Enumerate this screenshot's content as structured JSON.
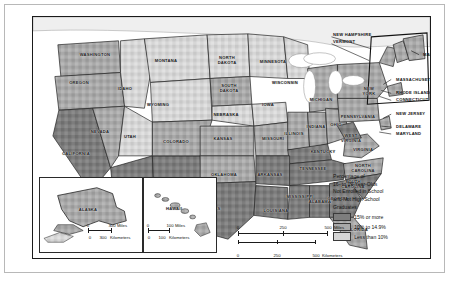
{
  "map": {
    "title_hidden": "",
    "legend": {
      "title_lines": [
        "Percentage of",
        "16- to 19-Year-Olds",
        "Not Enrolled in School",
        "and Not High School",
        "Graduates"
      ],
      "classes": [
        {
          "label": "15% or more",
          "color": "#7d7d7d"
        },
        {
          "label": "10% to 14.9%",
          "color": "#a9a9a9"
        },
        {
          "label": "Less than 10%",
          "color": "#d6d6d6"
        }
      ]
    },
    "scales": {
      "main": {
        "miles": {
          "ticks": [
            "0",
            "250",
            "500"
          ],
          "unit": "Miles"
        },
        "kilometers": {
          "ticks": [
            "0",
            "250",
            "500"
          ],
          "unit": "Kilometers"
        }
      },
      "alaska": {
        "miles": {
          "ticks": [
            "0",
            "300"
          ],
          "unit": "Miles"
        },
        "kilometers": {
          "ticks": [
            "0",
            "300"
          ],
          "unit": "Kilometers"
        }
      },
      "hawaii": {
        "miles": {
          "ticks": [
            "0",
            "100"
          ],
          "unit": "Miles"
        },
        "kilometers": {
          "ticks": [
            "0",
            "100"
          ],
          "unit": "Kilometers"
        }
      }
    },
    "insets": [
      {
        "name": "alaska",
        "label": "ALASKA"
      },
      {
        "name": "hawaii",
        "label": "HAWAII"
      }
    ],
    "state_labels": [
      {
        "name": "washington",
        "text": "WASHINGTON",
        "x": 62,
        "y": 38
      },
      {
        "name": "oregon",
        "text": "OREGON",
        "x": 46,
        "y": 66
      },
      {
        "name": "idaho",
        "text": "IDAHO",
        "x": 92,
        "y": 72
      },
      {
        "name": "montana",
        "text": "MONTANA",
        "x": 133,
        "y": 44
      },
      {
        "name": "wyoming",
        "text": "WYOMING",
        "x": 125,
        "y": 88
      },
      {
        "name": "north-dakota",
        "text": "NORTH\nDAKOTA",
        "x": 194,
        "y": 44
      },
      {
        "name": "south-dakota",
        "text": "SOUTH\nDAKOTA",
        "x": 196,
        "y": 72
      },
      {
        "name": "minnesota",
        "text": "MINNESOTA",
        "x": 240,
        "y": 45
      },
      {
        "name": "nebraska",
        "text": "NEBRASKA",
        "x": 193,
        "y": 98
      },
      {
        "name": "iowa",
        "text": "IOWA",
        "x": 235,
        "y": 88
      },
      {
        "name": "wisconsin",
        "text": "WISCONSIN",
        "x": 252,
        "y": 66
      },
      {
        "name": "michigan",
        "text": "MICHIGAN",
        "x": 288,
        "y": 83
      },
      {
        "name": "illinois",
        "text": "ILLINOIS",
        "x": 261,
        "y": 117
      },
      {
        "name": "indiana",
        "text": "INDIANA",
        "x": 283,
        "y": 110
      },
      {
        "name": "ohio",
        "text": "OHIO",
        "x": 303,
        "y": 108
      },
      {
        "name": "missouri",
        "text": "MISSOURI",
        "x": 240,
        "y": 122
      },
      {
        "name": "kansas",
        "text": "KANSAS",
        "x": 190,
        "y": 122
      },
      {
        "name": "colorado",
        "text": "COLORADO",
        "x": 143,
        "y": 125
      },
      {
        "name": "utah",
        "text": "UTAH",
        "x": 97,
        "y": 120
      },
      {
        "name": "nevada",
        "text": "NEVADA",
        "x": 67,
        "y": 115
      },
      {
        "name": "california",
        "text": "CALIFORNIA",
        "x": 43,
        "y": 137
      },
      {
        "name": "arizona",
        "text": "ARIZONA",
        "x": 96,
        "y": 170
      },
      {
        "name": "new-mexico",
        "text": "NEW\nMEXICO",
        "x": 143,
        "y": 172
      },
      {
        "name": "oklahoma",
        "text": "OKLAHOMA",
        "x": 191,
        "y": 158
      },
      {
        "name": "texas",
        "text": "TEXAS",
        "x": 180,
        "y": 192
      },
      {
        "name": "arkansas",
        "text": "ARKANSAS",
        "x": 237,
        "y": 158
      },
      {
        "name": "louisiana",
        "text": "LOUISIANA",
        "x": 243,
        "y": 194
      },
      {
        "name": "mississippi",
        "text": "MISSISSIPPI",
        "x": 267,
        "y": 180
      },
      {
        "name": "alabama",
        "text": "ALABAMA",
        "x": 287,
        "y": 185
      },
      {
        "name": "tennessee",
        "text": "TENNESSEE",
        "x": 280,
        "y": 152
      },
      {
        "name": "kentucky",
        "text": "KENTUCKY",
        "x": 290,
        "y": 135
      },
      {
        "name": "west-virginia",
        "text": "WEST\nVIRGINIA",
        "x": 318,
        "y": 122
      },
      {
        "name": "virginia",
        "text": "VIRGINIA",
        "x": 330,
        "y": 133
      },
      {
        "name": "north-carolina",
        "text": "NORTH\nCAROLINA",
        "x": 330,
        "y": 152
      },
      {
        "name": "south-carolina",
        "text": "SOUTH\nCAROLINA",
        "x": 320,
        "y": 168
      },
      {
        "name": "georgia",
        "text": "GEORGIA",
        "x": 305,
        "y": 182
      },
      {
        "name": "florida",
        "text": "FLORIDA",
        "x": 325,
        "y": 213
      },
      {
        "name": "pennsylvania",
        "text": "PENNSYLVANIA",
        "x": 325,
        "y": 100
      },
      {
        "name": "new-york",
        "text": "NEW\nYORK",
        "x": 336,
        "y": 75
      }
    ],
    "callout_labels": [
      {
        "name": "new-hampshire",
        "text": "NEW HAMPSHIRE",
        "x": 300,
        "y": 18
      },
      {
        "name": "vermont",
        "text": "VERMONT",
        "x": 300,
        "y": 25
      },
      {
        "name": "maine",
        "text": "MAINE",
        "x": 390,
        "y": 38
      },
      {
        "name": "massachusetts",
        "text": "MASSACHUSETTS",
        "x": 363,
        "y": 63
      },
      {
        "name": "rhode-island",
        "text": "RHODE ISLAND",
        "x": 363,
        "y": 76
      },
      {
        "name": "connecticut",
        "text": "CONNECTICUT",
        "x": 363,
        "y": 83
      },
      {
        "name": "new-jersey",
        "text": "NEW JERSEY",
        "x": 363,
        "y": 97
      },
      {
        "name": "delaware",
        "text": "DELAWARE",
        "x": 363,
        "y": 110
      },
      {
        "name": "maryland",
        "text": "MARYLAND",
        "x": 363,
        "y": 117
      }
    ]
  }
}
